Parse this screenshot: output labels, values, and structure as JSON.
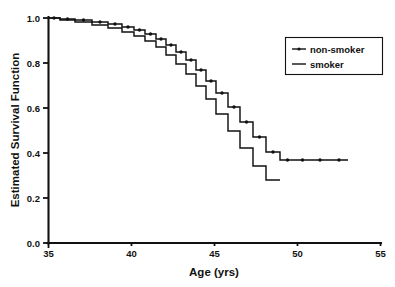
{
  "chart_data": {
    "type": "line",
    "title": "",
    "xlabel": "Age (yrs)",
    "ylabel": "Estimated Survival Function",
    "xlim": [
      35,
      55
    ],
    "ylim": [
      0.0,
      1.0
    ],
    "xticks": [
      35,
      40,
      45,
      50,
      55
    ],
    "xtick_labels": [
      "35",
      "40",
      "45",
      "50",
      "55"
    ],
    "yticks": [
      0.0,
      0.2,
      0.4,
      0.6,
      0.8,
      1.0
    ],
    "ytick_labels": [
      "0.0",
      "0.2",
      "0.4",
      "0.6",
      "0.8",
      "1.0"
    ],
    "grid": false,
    "step_style": "post",
    "legend": {
      "position": "upper right",
      "entries": [
        {
          "label": "non-smoker",
          "style": "line-with-marker",
          "color": "#111111"
        },
        {
          "label": "smoker",
          "style": "line",
          "color": "#111111"
        }
      ]
    },
    "series": [
      {
        "name": "non-smoker",
        "marker": "dot",
        "x": [
          35.0,
          36.2,
          37.3,
          38.4,
          39.3,
          40.2,
          41.1,
          42.0,
          42.8,
          43.5,
          44.2,
          44.9,
          45.6,
          46.2,
          46.8,
          47.4,
          48.0,
          48.6,
          49.2,
          49.8,
          50.4,
          51.0,
          51.6,
          52.2,
          53.0
        ],
        "y": [
          1.0,
          0.998,
          0.995,
          0.992,
          0.988,
          0.984,
          0.979,
          0.973,
          0.966,
          0.957,
          0.946,
          0.934,
          0.92,
          0.905,
          0.888,
          0.87,
          0.849,
          0.824,
          0.796,
          0.763,
          0.726,
          0.684,
          0.637,
          0.586,
          0.53
        ]
      },
      {
        "name": "smoker",
        "marker": "none",
        "x": [
          35.0,
          36.2,
          37.3,
          38.4,
          39.3,
          40.2,
          41.1,
          42.0,
          42.8,
          43.5,
          44.2,
          44.9,
          45.6,
          46.2,
          46.8,
          47.4,
          48.0,
          48.6,
          49.2,
          49.8,
          50.4,
          51.0,
          51.6,
          52.2,
          53.0
        ],
        "y": [
          1.0,
          0.997,
          0.993,
          0.989,
          0.984,
          0.978,
          0.971,
          0.963,
          0.953,
          0.941,
          0.927,
          0.911,
          0.892,
          0.871,
          0.847,
          0.82,
          0.79,
          0.756,
          0.718,
          0.676,
          0.63,
          0.58,
          0.527,
          0.47,
          0.41
        ]
      }
    ],
    "curves_pixels": {
      "note": "stepwise Kaplan-Meier survival curves drawn as step-post polylines",
      "nonsmoker": [
        [
          48,
          18
        ],
        [
          60,
          18
        ],
        [
          60,
          19
        ],
        [
          75,
          19
        ],
        [
          75,
          20
        ],
        [
          92,
          20
        ],
        [
          92,
          22
        ],
        [
          108,
          22
        ],
        [
          108,
          24
        ],
        [
          122,
          24
        ],
        [
          122,
          27
        ],
        [
          134,
          27
        ],
        [
          134,
          30
        ],
        [
          145,
          30
        ],
        [
          145,
          34
        ],
        [
          156,
          34
        ],
        [
          156,
          39
        ],
        [
          166,
          39
        ],
        [
          166,
          45
        ],
        [
          176,
          45
        ],
        [
          176,
          52
        ],
        [
          186,
          52
        ],
        [
          186,
          60
        ],
        [
          196,
          60
        ],
        [
          196,
          70
        ],
        [
          206,
          70
        ],
        [
          206,
          81
        ],
        [
          216,
          81
        ],
        [
          216,
          93
        ],
        [
          228,
          93
        ],
        [
          228,
          107
        ],
        [
          240,
          107
        ],
        [
          240,
          122
        ],
        [
          253,
          122
        ],
        [
          253,
          137
        ],
        [
          266,
          137
        ],
        [
          266,
          152
        ],
        [
          280,
          152
        ],
        [
          280,
          160
        ],
        [
          295,
          160
        ],
        [
          295,
          160
        ],
        [
          310,
          160
        ],
        [
          310,
          160
        ],
        [
          330,
          160
        ],
        [
          330,
          160
        ],
        [
          348,
          160
        ]
      ],
      "smoker": [
        [
          48,
          18
        ],
        [
          60,
          18
        ],
        [
          60,
          20
        ],
        [
          75,
          20
        ],
        [
          75,
          22
        ],
        [
          92,
          22
        ],
        [
          92,
          25
        ],
        [
          108,
          25
        ],
        [
          108,
          28
        ],
        [
          122,
          28
        ],
        [
          122,
          32
        ],
        [
          134,
          32
        ],
        [
          134,
          36
        ],
        [
          145,
          36
        ],
        [
          145,
          41
        ],
        [
          156,
          41
        ],
        [
          156,
          47
        ],
        [
          166,
          47
        ],
        [
          166,
          55
        ],
        [
          176,
          55
        ],
        [
          176,
          64
        ],
        [
          186,
          64
        ],
        [
          186,
          74
        ],
        [
          196,
          74
        ],
        [
          196,
          86
        ],
        [
          206,
          86
        ],
        [
          206,
          99
        ],
        [
          216,
          99
        ],
        [
          216,
          114
        ],
        [
          228,
          114
        ],
        [
          228,
          131
        ],
        [
          240,
          131
        ],
        [
          240,
          148
        ],
        [
          253,
          148
        ],
        [
          253,
          166
        ],
        [
          266,
          166
        ],
        [
          266,
          180
        ],
        [
          280,
          180
        ]
      ]
    }
  },
  "axes": {
    "x_title": "Age (yrs)",
    "y_title": "Estimated Survival Function"
  }
}
